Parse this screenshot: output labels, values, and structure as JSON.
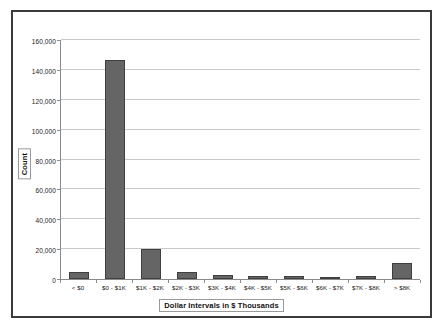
{
  "chart_data": {
    "type": "bar",
    "title": "",
    "xlabel": "Dollar Intervals in $ Thousands",
    "ylabel": "Count",
    "categories": [
      "< $0",
      "$0 - $1K",
      "$1K - $2K",
      "$2K - $3K",
      "$3K - $4K",
      "$4K - $5K",
      "$5K - $6K",
      "$6K - $7K",
      "$7K - $8K",
      "> $8K"
    ],
    "values": [
      4500,
      146500,
      20000,
      4400,
      2500,
      1800,
      1900,
      1400,
      2200,
      11000
    ],
    "ylim": [
      0,
      160000
    ],
    "ytick_values": [
      0,
      20000,
      40000,
      60000,
      80000,
      100000,
      120000,
      140000,
      160000
    ],
    "ytick_labels": [
      "0",
      "20,000",
      "40,000",
      "60,000",
      "80,000",
      "100,000",
      "120,000",
      "140,000",
      "160,000"
    ],
    "grid": true,
    "legend": false,
    "bar_color": "#656565",
    "bar_border_color": "#3f3f3f",
    "gridline_color": "#c9c9c9",
    "axis_color": "#8a8a8a",
    "frame_color": "#3a3a3a",
    "background_color": "#ffffff"
  }
}
